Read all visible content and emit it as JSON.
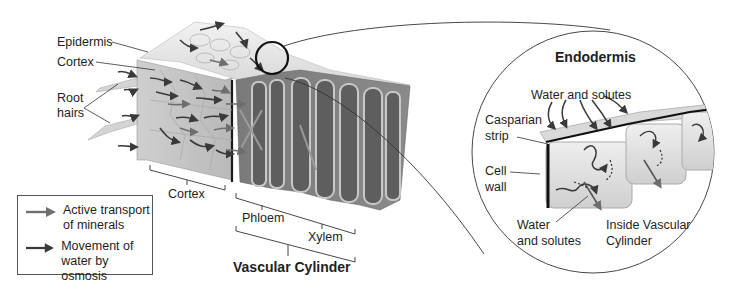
{
  "diagram": {
    "type": "plant root cross-section with endodermis detail",
    "labels": {
      "epidermis": "Epidermis",
      "cortex_top": "Cortex",
      "root_hairs_line1": "Root",
      "root_hairs_line2": "hairs",
      "cortex_bottom": "Cortex",
      "phloem": "Phloem",
      "xylem": "Xylem",
      "vascular_cylinder": "Vascular Cylinder"
    },
    "detail": {
      "title": "Endodermis",
      "water_solutes_top": "Water and solutes",
      "casparian_line1": "Casparian",
      "casparian_line2": "strip",
      "cell_wall_line1": "Cell",
      "cell_wall_line2": "wall",
      "water_solutes_bottom_line1": "Water",
      "water_solutes_bottom_line2": "and solutes",
      "inside_line1": "Inside Vascular",
      "inside_line2": "Cylinder"
    },
    "legend": {
      "items": [
        {
          "line1": "Active transport",
          "line2": "of minerals",
          "color": "#6e6e6e"
        },
        {
          "line1": "Movement of",
          "line2": "water by osmosis",
          "color": "#3a3a3a"
        }
      ]
    },
    "colors": {
      "arrow_active": "#6e6e6e",
      "arrow_water": "#3a3a3a",
      "tissue_light": "#d9d9d9",
      "tissue_mid": "#b5b5b5",
      "tissue_dark": "#6b6b6b",
      "outline": "#222222"
    }
  }
}
